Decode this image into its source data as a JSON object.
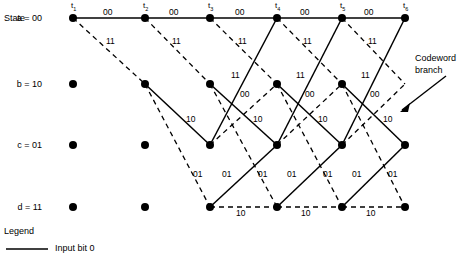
{
  "figure": {
    "kind": "convolutional-code-trellis",
    "state_axis_label": "State",
    "annotation": {
      "line1": "Codeword",
      "line2": "branch"
    }
  },
  "states": [
    {
      "id": "a",
      "label": "a = 00",
      "y": 18
    },
    {
      "id": "b",
      "label": "b = 10",
      "y": 84
    },
    {
      "id": "c",
      "label": "c = 01",
      "y": 145
    },
    {
      "id": "d",
      "label": "d = 11",
      "y": 207
    }
  ],
  "time_ticks": [
    {
      "label": "t",
      "sub": "1",
      "x": 73
    },
    {
      "label": "t",
      "sub": "2",
      "x": 145
    },
    {
      "label": "t",
      "sub": "3",
      "x": 210
    },
    {
      "label": "t",
      "sub": "4",
      "x": 277
    },
    {
      "label": "t",
      "sub": "5",
      "x": 342
    },
    {
      "label": "t",
      "sub": "6",
      "x": 405
    }
  ],
  "nodes": [
    {
      "state": "a",
      "x": 73,
      "y": 18
    },
    {
      "state": "a",
      "x": 145,
      "y": 18
    },
    {
      "state": "a",
      "x": 210,
      "y": 18
    },
    {
      "state": "a",
      "x": 277,
      "y": 18
    },
    {
      "state": "a",
      "x": 342,
      "y": 18
    },
    {
      "state": "a",
      "x": 405,
      "y": 18
    },
    {
      "state": "b",
      "x": 73,
      "y": 84
    },
    {
      "state": "b",
      "x": 145,
      "y": 84
    },
    {
      "state": "b",
      "x": 210,
      "y": 84
    },
    {
      "state": "b",
      "x": 277,
      "y": 84
    },
    {
      "state": "b",
      "x": 342,
      "y": 84
    },
    {
      "state": "c",
      "x": 73,
      "y": 145
    },
    {
      "state": "c",
      "x": 145,
      "y": 145
    },
    {
      "state": "c",
      "x": 210,
      "y": 145
    },
    {
      "state": "c",
      "x": 277,
      "y": 145
    },
    {
      "state": "c",
      "x": 342,
      "y": 145
    },
    {
      "state": "c",
      "x": 405,
      "y": 145
    },
    {
      "state": "d",
      "x": 73,
      "y": 207
    },
    {
      "state": "d",
      "x": 145,
      "y": 207
    },
    {
      "state": "d",
      "x": 210,
      "y": 207
    },
    {
      "state": "d",
      "x": 277,
      "y": 207
    },
    {
      "state": "d",
      "x": 342,
      "y": 207
    },
    {
      "state": "d",
      "x": 405,
      "y": 207
    }
  ],
  "branches": [
    {
      "x1": 73,
      "y1": 18,
      "x2": 145,
      "y2": 18,
      "style": "solid",
      "input": "0"
    },
    {
      "x1": 145,
      "y1": 18,
      "x2": 210,
      "y2": 18,
      "style": "solid",
      "input": "0"
    },
    {
      "x1": 210,
      "y1": 18,
      "x2": 277,
      "y2": 18,
      "style": "solid",
      "input": "0"
    },
    {
      "x1": 277,
      "y1": 18,
      "x2": 342,
      "y2": 18,
      "style": "solid",
      "input": "0"
    },
    {
      "x1": 342,
      "y1": 18,
      "x2": 405,
      "y2": 18,
      "style": "solid",
      "input": "0"
    },
    {
      "x1": 73,
      "y1": 18,
      "x2": 145,
      "y2": 84,
      "style": "dashed",
      "input": "1"
    },
    {
      "x1": 145,
      "y1": 18,
      "x2": 210,
      "y2": 84,
      "style": "dashed",
      "input": "1"
    },
    {
      "x1": 210,
      "y1": 18,
      "x2": 277,
      "y2": 84,
      "style": "dashed",
      "input": "1"
    },
    {
      "x1": 277,
      "y1": 18,
      "x2": 342,
      "y2": 84,
      "style": "dashed",
      "input": "1"
    },
    {
      "x1": 342,
      "y1": 18,
      "x2": 405,
      "y2": 84,
      "style": "dashed",
      "input": "1"
    },
    {
      "x1": 145,
      "y1": 84,
      "x2": 210,
      "y2": 145,
      "style": "solid",
      "input": "0"
    },
    {
      "x1": 210,
      "y1": 84,
      "x2": 277,
      "y2": 145,
      "style": "solid",
      "input": "0"
    },
    {
      "x1": 277,
      "y1": 84,
      "x2": 342,
      "y2": 145,
      "style": "solid",
      "input": "0"
    },
    {
      "x1": 342,
      "y1": 84,
      "x2": 405,
      "y2": 145,
      "style": "solid",
      "input": "0"
    },
    {
      "x1": 145,
      "y1": 84,
      "x2": 210,
      "y2": 207,
      "style": "dashed",
      "input": "1"
    },
    {
      "x1": 210,
      "y1": 84,
      "x2": 277,
      "y2": 207,
      "style": "dashed",
      "input": "1"
    },
    {
      "x1": 277,
      "y1": 84,
      "x2": 342,
      "y2": 207,
      "style": "dashed",
      "input": "1"
    },
    {
      "x1": 342,
      "y1": 84,
      "x2": 405,
      "y2": 207,
      "style": "dashed",
      "input": "1"
    },
    {
      "x1": 210,
      "y1": 145,
      "x2": 277,
      "y2": 18,
      "style": "solid",
      "input": "0"
    },
    {
      "x1": 277,
      "y1": 145,
      "x2": 342,
      "y2": 18,
      "style": "solid",
      "input": "0"
    },
    {
      "x1": 342,
      "y1": 145,
      "x2": 405,
      "y2": 18,
      "style": "solid",
      "input": "0"
    },
    {
      "x1": 210,
      "y1": 145,
      "x2": 277,
      "y2": 84,
      "style": "dashed",
      "input": "1"
    },
    {
      "x1": 277,
      "y1": 145,
      "x2": 342,
      "y2": 84,
      "style": "dashed",
      "input": "1"
    },
    {
      "x1": 342,
      "y1": 145,
      "x2": 405,
      "y2": 84,
      "style": "dashed",
      "input": "1"
    },
    {
      "x1": 210,
      "y1": 207,
      "x2": 277,
      "y2": 145,
      "style": "solid",
      "input": "0"
    },
    {
      "x1": 277,
      "y1": 207,
      "x2": 342,
      "y2": 145,
      "style": "solid",
      "input": "0"
    },
    {
      "x1": 342,
      "y1": 207,
      "x2": 405,
      "y2": 145,
      "style": "solid",
      "input": "0"
    },
    {
      "x1": 210,
      "y1": 207,
      "x2": 277,
      "y2": 207,
      "style": "dashed",
      "input": "1"
    },
    {
      "x1": 277,
      "y1": 207,
      "x2": 342,
      "y2": 207,
      "style": "dashed",
      "input": "1"
    },
    {
      "x1": 342,
      "y1": 207,
      "x2": 405,
      "y2": 207,
      "style": "dashed",
      "input": "1"
    }
  ],
  "branch_labels": [
    {
      "text": "00",
      "x": 103,
      "y": 8
    },
    {
      "text": "00",
      "x": 169,
      "y": 8
    },
    {
      "text": "00",
      "x": 235,
      "y": 8
    },
    {
      "text": "00",
      "x": 300,
      "y": 8
    },
    {
      "text": "00",
      "x": 364,
      "y": 8
    },
    {
      "text": "11",
      "x": 106,
      "y": 37
    },
    {
      "text": "11",
      "x": 172,
      "y": 37
    },
    {
      "text": "11",
      "x": 238,
      "y": 37
    },
    {
      "text": "11",
      "x": 303,
      "y": 37
    },
    {
      "text": "11",
      "x": 368,
      "y": 37
    },
    {
      "text": "11",
      "x": 231,
      "y": 71
    },
    {
      "text": "11",
      "x": 296,
      "y": 71
    },
    {
      "text": "11",
      "x": 361,
      "y": 71
    },
    {
      "text": "00",
      "x": 240,
      "y": 90
    },
    {
      "text": "00",
      "x": 305,
      "y": 90
    },
    {
      "text": "00",
      "x": 370,
      "y": 90
    },
    {
      "text": "10",
      "x": 186,
      "y": 115
    },
    {
      "text": "10",
      "x": 253,
      "y": 115
    },
    {
      "text": "10",
      "x": 318,
      "y": 115
    },
    {
      "text": "10",
      "x": 383,
      "y": 115
    },
    {
      "text": "01",
      "x": 193,
      "y": 170
    },
    {
      "text": "01",
      "x": 222,
      "y": 170
    },
    {
      "text": "01",
      "x": 258,
      "y": 170
    },
    {
      "text": "01",
      "x": 287,
      "y": 170
    },
    {
      "text": "01",
      "x": 323,
      "y": 170
    },
    {
      "text": "01",
      "x": 352,
      "y": 170
    },
    {
      "text": "01",
      "x": 388,
      "y": 170
    },
    {
      "text": "10",
      "x": 236,
      "y": 209
    },
    {
      "text": "10",
      "x": 301,
      "y": 209
    },
    {
      "text": "10",
      "x": 366,
      "y": 209
    }
  ],
  "legend": {
    "title": "Legend",
    "entries": [
      {
        "style": "solid",
        "label": "Input bit 0"
      }
    ]
  },
  "colors": {
    "ink": "#000000",
    "background": "#ffffff"
  }
}
